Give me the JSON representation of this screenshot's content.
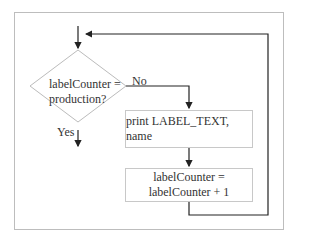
{
  "diagram": {
    "type": "flowchart",
    "decision": {
      "line1": "labelCounter =",
      "line2": "production?"
    },
    "branches": {
      "no": "No",
      "yes": "Yes"
    },
    "process_print": {
      "text": "print LABEL_TEXT, name"
    },
    "process_increment": {
      "line1": "labelCounter =",
      "line2": "labelCounter + 1"
    },
    "colors": {
      "line": "#222222",
      "box_border": "#c8c8c8",
      "frame_border": "#bdbdbd",
      "background": "#ffffff"
    }
  }
}
